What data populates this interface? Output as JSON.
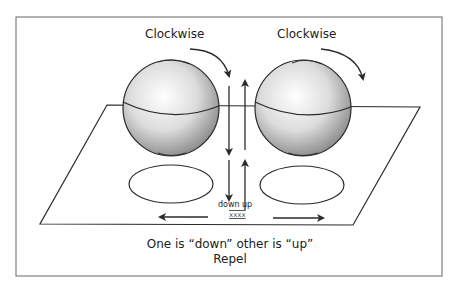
{
  "diagram": {
    "left_sphere": {
      "rotation_label": "Clockwise"
    },
    "right_sphere": {
      "rotation_label": "Clockwise"
    },
    "center_labels": {
      "down": "down",
      "up": "up",
      "marker": "xxxx"
    },
    "caption": {
      "line1": "One is “down” other is “up”",
      "line2": "Repel"
    },
    "colors": {
      "stroke": "#2a2a2a",
      "frame": "#555555",
      "background": "#ffffff"
    }
  }
}
